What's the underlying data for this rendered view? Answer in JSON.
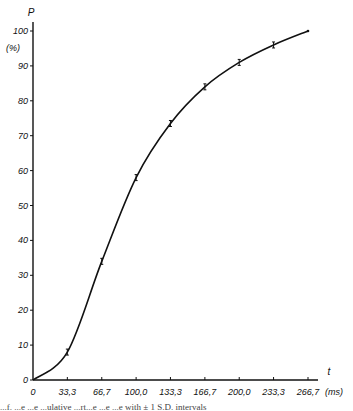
{
  "chart_data": {
    "type": "line",
    "title": "",
    "xlabel": "t",
    "xunit": "(ms)",
    "ylabel": "P",
    "yunit": "(%)",
    "x": [
      0,
      33.3,
      66.7,
      100.0,
      133.3,
      166.7,
      200.0,
      233.3,
      266.7
    ],
    "x_tick_labels": [
      "0",
      "33,3",
      "66,7",
      "100,0",
      "133,3",
      "166,7",
      "200,0",
      "233,3",
      "266,7"
    ],
    "y_ticks": [
      0,
      10,
      20,
      30,
      40,
      50,
      60,
      70,
      80,
      90,
      100
    ],
    "series": [
      {
        "name": "P",
        "values": [
          0,
          8,
          34,
          58,
          73.5,
          84,
          91,
          96,
          100
        ],
        "error_bars": true
      }
    ],
    "xlim": [
      0,
      275
    ],
    "ylim": [
      0,
      100
    ],
    "grid": false,
    "legend": null
  },
  "caption": "...f. ...e ...e ...ulative ...rt...e ...e ...e with ± 1 S.D. intervals"
}
